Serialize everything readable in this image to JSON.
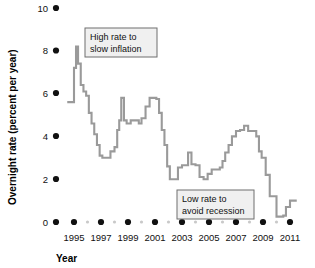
{
  "chart_data": {
    "type": "line",
    "title": "",
    "xlabel": "Year",
    "ylabel": "Overnight rate (percent per year)",
    "xlim": [
      1994.4,
      2011.6
    ],
    "ylim": [
      0,
      10
    ],
    "grid": false,
    "legend": "none",
    "line_color": "#9a9a9a",
    "y_ticks": [
      0,
      2,
      4,
      6,
      8,
      10
    ],
    "y_tick_labels": [
      "0",
      "2",
      "4",
      "6",
      "8",
      "10"
    ],
    "x_ticks_major": [
      1995,
      1997,
      1999,
      2001,
      2003,
      2005,
      2007,
      2009,
      2011
    ],
    "x_tick_labels": [
      "1995",
      "1997",
      "1999",
      "2001",
      "2003",
      "2005",
      "2007",
      "2009",
      "2011"
    ],
    "x_ticks_minor": [
      1996,
      1998,
      2000,
      2002,
      2004,
      2006,
      2008,
      2010
    ],
    "series": [
      {
        "name": "Overnight rate",
        "step": true,
        "x": [
          1994.5,
          1994.75,
          1995.0,
          1995.15,
          1995.3,
          1995.5,
          1995.7,
          1995.9,
          1996.1,
          1996.3,
          1996.5,
          1996.7,
          1996.9,
          1997.1,
          1997.4,
          1997.7,
          1998.0,
          1998.2,
          1998.35,
          1998.5,
          1998.7,
          1998.9,
          1999.2,
          1999.5,
          1999.8,
          2000.0,
          2000.3,
          2000.6,
          2000.9,
          2001.1,
          2001.3,
          2001.5,
          2001.7,
          2001.9,
          2002.1,
          2002.4,
          2002.7,
          2003.0,
          2003.2,
          2003.45,
          2003.7,
          2004.0,
          2004.3,
          2004.6,
          2004.9,
          2005.2,
          2005.5,
          2005.8,
          2006.0,
          2006.2,
          2006.45,
          2006.7,
          2007.0,
          2007.3,
          2007.6,
          2007.9,
          2008.1,
          2008.3,
          2008.5,
          2008.7,
          2008.9,
          2009.05,
          2009.2,
          2009.5,
          2010.0,
          2010.3,
          2010.5,
          2010.7,
          2011.0,
          2011.5
        ],
        "y": [
          5.6,
          5.6,
          7.2,
          8.2,
          7.4,
          6.4,
          6.1,
          5.9,
          5.1,
          4.6,
          4.1,
          3.6,
          3.1,
          3.0,
          3.0,
          3.3,
          3.5,
          4.3,
          4.75,
          5.8,
          4.75,
          4.6,
          4.75,
          4.75,
          4.6,
          4.85,
          5.4,
          5.8,
          5.8,
          5.75,
          5.1,
          4.3,
          3.6,
          2.6,
          2.0,
          2.0,
          2.55,
          2.65,
          2.65,
          3.25,
          2.7,
          2.65,
          2.1,
          2.0,
          2.25,
          2.45,
          2.45,
          2.55,
          2.85,
          3.25,
          3.6,
          4.0,
          4.25,
          4.3,
          4.5,
          4.25,
          4.25,
          4.25,
          4.0,
          3.3,
          3.0,
          3.0,
          2.2,
          1.2,
          0.25,
          0.25,
          0.3,
          0.7,
          1.0,
          1.0
        ]
      }
    ],
    "annotations": [
      {
        "id": "high-rate",
        "line1": "High rate to",
        "line2": "slow inflation",
        "box": {
          "x": 85,
          "y": 28,
          "w": 72,
          "h": 29
        }
      },
      {
        "id": "low-rate",
        "line1": "Low rate to",
        "line2": "avoid recession",
        "box": {
          "x": 177,
          "y": 190,
          "w": 77,
          "h": 29
        }
      }
    ]
  }
}
